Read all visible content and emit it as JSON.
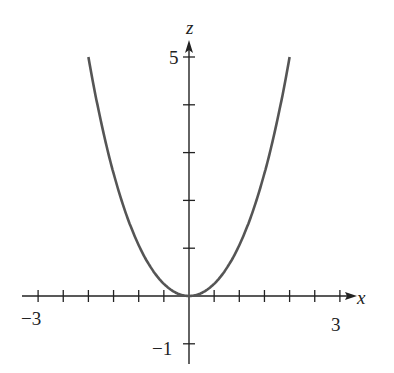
{
  "chart_data": {
    "type": "line",
    "title": "",
    "xlabel": "x",
    "ylabel": "z",
    "xlim": [
      -3.3,
      3.4
    ],
    "ylim": [
      -1.3,
      5.4
    ],
    "grid": false,
    "x_ticks": [
      -3,
      -2.5,
      -2,
      -1.5,
      -1,
      -0.5,
      0.5,
      1,
      1.5,
      2,
      2.5,
      3
    ],
    "x_tick_labels": [
      {
        "value": -3,
        "label": "−3"
      },
      {
        "value": 3,
        "label": "3"
      }
    ],
    "z_ticks": [
      -1,
      1,
      2,
      3,
      4,
      5
    ],
    "z_tick_labels": [
      {
        "value": 5,
        "label": "5"
      },
      {
        "value": -1,
        "label": "−1"
      }
    ],
    "series": [
      {
        "name": "curve",
        "color": "#555555",
        "x": [
          -2.0,
          -1.75,
          -1.5,
          -1.25,
          -1.0,
          -0.75,
          -0.5,
          -0.25,
          0,
          0.25,
          0.5,
          0.75,
          1.0,
          1.25,
          1.5,
          1.75,
          2.0
        ],
        "values": [
          5.0,
          3.6,
          2.57,
          1.71,
          1.06,
          0.58,
          0.25,
          0.06,
          0,
          0.06,
          0.25,
          0.58,
          1.06,
          1.71,
          2.57,
          3.6,
          5.0
        ]
      }
    ]
  },
  "labels": {
    "x_axis": "x",
    "z_axis": "z",
    "x_min": "−3",
    "x_max": "3",
    "z_max": "5",
    "z_min": "−1"
  }
}
